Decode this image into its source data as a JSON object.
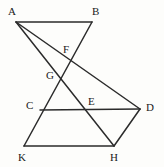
{
  "figure": {
    "background_color": "#fdfdfb",
    "stroke_color": "#2b2b2b",
    "label_color": "#1a1a1a",
    "width": 164,
    "height": 167,
    "points": [
      {
        "id": "A",
        "label": "A",
        "x": 16,
        "y": 22,
        "label_x": 8,
        "label_y": 6
      },
      {
        "id": "B",
        "label": "B",
        "x": 92,
        "y": 22,
        "label_x": 92,
        "label_y": 6
      },
      {
        "id": "F",
        "label": "F",
        "x": 70,
        "y": 58,
        "label_x": 63,
        "label_y": 44
      },
      {
        "id": "G",
        "label": "G",
        "x": 60,
        "y": 80,
        "label_x": 46,
        "label_y": 70
      },
      {
        "id": "C",
        "label": "C",
        "x": 40,
        "y": 110,
        "label_x": 26,
        "label_y": 100
      },
      {
        "id": "E",
        "label": "E",
        "x": 93,
        "y": 110,
        "label_x": 88,
        "label_y": 96
      },
      {
        "id": "D",
        "label": "D",
        "x": 140,
        "y": 109,
        "label_x": 146,
        "label_y": 102
      },
      {
        "id": "K",
        "label": "K",
        "x": 24,
        "y": 146,
        "label_x": 18,
        "label_y": 152
      },
      {
        "id": "H",
        "label": "H",
        "x": 114,
        "y": 146,
        "label_x": 110,
        "label_y": 152
      }
    ],
    "segments": [
      {
        "id": "AB",
        "from": "A",
        "to": "B",
        "path": "M 16 22 L 92 22"
      },
      {
        "id": "BK",
        "from": "B",
        "to": "K",
        "path": "M 92 22 L 24 146"
      },
      {
        "id": "AD",
        "from": "A",
        "to": "D",
        "path": "M 16 22 L 140 109"
      },
      {
        "id": "AH",
        "from": "A",
        "to": "H",
        "path": "M 16 22 L 114 146"
      },
      {
        "id": "CD",
        "from": "C",
        "to": "D",
        "path": "M 40 110 L 140 109"
      },
      {
        "id": "KH",
        "from": "K",
        "to": "H",
        "path": "M 24 146 L 114 146"
      },
      {
        "id": "DH",
        "from": "D",
        "to": "H",
        "path": "M 140 109 L 114 146"
      }
    ]
  }
}
